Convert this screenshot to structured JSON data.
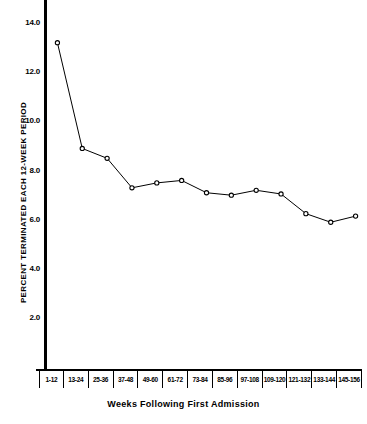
{
  "chart_data": {
    "type": "line",
    "title": "",
    "xlabel": "Weeks Following First Admission",
    "ylabel": "PERCENT TERMINATED EACH 12-WEEK PERIOD",
    "categories": [
      "1-12",
      "13-24",
      "25-36",
      "37-48",
      "49-60",
      "61-72",
      "73-84",
      "85-96",
      "97-108",
      "109-120",
      "121-132",
      "133-144",
      "145-156"
    ],
    "values": [
      13.2,
      8.9,
      8.5,
      7.3,
      7.5,
      7.6,
      7.1,
      7.0,
      7.2,
      7.05,
      6.25,
      5.9,
      6.15
    ],
    "ylim": [
      0.0,
      14.8
    ],
    "yticks": [
      14.0,
      12.0,
      10.0,
      8.0,
      6.0,
      4.0,
      2.0
    ],
    "ytick_labels": [
      "14.0",
      "12.0",
      "10.0",
      "8.0",
      "6.0",
      "4.0",
      "2.0"
    ],
    "grid": false,
    "legend": false,
    "marker": "open-circle",
    "line_color": "#000000",
    "marker_color": "#000000"
  }
}
